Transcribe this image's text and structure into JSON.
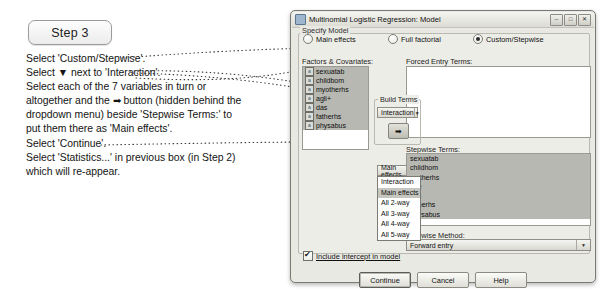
{
  "annotation": {
    "step_badge": "Step 3",
    "lines": [
      "Select 'Custom/Stepwise'.",
      "Select ▼ next to 'Interaction'.",
      "Select each of the 7 variables in turn or",
      "altogether and the ➡ button (hidden behind the",
      "dropdown menu) beside 'Stepwise Terms:' to",
      "put them there as 'Main effects'.",
      "Select 'Continue'.",
      "Select 'Statistics...' in previous box (in Step 2)",
      "which will re-appear."
    ]
  },
  "dialog": {
    "title": "Multinomial Logistic Regression: Model",
    "window_buttons": [
      "–",
      "□",
      "✕"
    ],
    "specify_model": {
      "legend": "Specify Model",
      "options": [
        {
          "label": "Main effects",
          "underline": "M",
          "selected": false
        },
        {
          "label": "Full factorial",
          "underline": "f",
          "selected": false
        },
        {
          "label": "Custom/Stepwise",
          "underline": "C",
          "selected": true
        }
      ]
    },
    "factors_label": "Factors & Covariates:",
    "factors": [
      "sexuatab",
      "childbom",
      "myotherhs",
      "agli+",
      "das",
      "fatherhs",
      "physabus"
    ],
    "forced_entry_label": "Forced Entry Terms:",
    "forced_entry_items": [],
    "build_terms": {
      "legend": "Build Terms",
      "selected": "Interaction",
      "arrow_button": "➡"
    },
    "dropdown": {
      "selected": "Main effects",
      "options": [
        "Interaction",
        "Main effects",
        "All 2-way",
        "All 3-way",
        "All 4-way",
        "All 5-way"
      ],
      "highlighted_index": 1
    },
    "stepwise_terms_label": "Stepwise Terms:",
    "stepwise_terms": [
      "sexuatab",
      "childhom",
      "motherhs",
      "age",
      "das",
      "fatherhs",
      "physabus"
    ],
    "stepwise_method_label": "Stepwise Method:",
    "stepwise_method_value": "Forward entry",
    "intercept_label": "Include intercept in model",
    "intercept_checked": true,
    "buttons": [
      {
        "label": "Continue",
        "default": true
      },
      {
        "label": "Cancel",
        "default": false
      },
      {
        "label": "Help",
        "default": false
      }
    ]
  },
  "colors": {
    "dialog_face": "#e9e9e4",
    "group_face": "#edede8",
    "selection": "#b8b8b2",
    "border": "#9a9a93",
    "text": "#101010"
  }
}
